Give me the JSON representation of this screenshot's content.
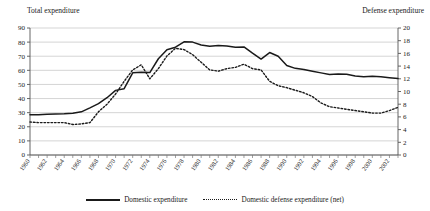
{
  "chart_data": {
    "type": "line",
    "title": "",
    "xlabel": "",
    "ylabel": "Total expenditure",
    "y2label": "Defense expenditure",
    "ylim": [
      0,
      90
    ],
    "y2lim": [
      0,
      20
    ],
    "grid": true,
    "legend_position": "bottom",
    "yticks": [
      0,
      10,
      20,
      30,
      40,
      50,
      60,
      70,
      80,
      90
    ],
    "y2ticks": [
      0,
      2,
      4,
      6,
      8,
      10,
      12,
      14,
      16,
      18,
      20
    ],
    "x": [
      1960,
      1961,
      1962,
      1963,
      1964,
      1965,
      1966,
      1967,
      1968,
      1969,
      1970,
      1971,
      1972,
      1973,
      1974,
      1975,
      1976,
      1977,
      1978,
      1979,
      1980,
      1981,
      1982,
      1983,
      1984,
      1985,
      1986,
      1987,
      1988,
      1989,
      1990,
      1991,
      1992,
      1993,
      1994,
      1995,
      1996,
      1997,
      1998,
      1999,
      2000,
      2001,
      2002,
      2003
    ],
    "xtick_labels": [
      "1960",
      "1962",
      "1964",
      "1966",
      "1968",
      "1970",
      "1972",
      "1974",
      "1976",
      "1978",
      "1980",
      "1982",
      "1984",
      "1986",
      "1988",
      "1990",
      "1992",
      "1994",
      "1996",
      "1998",
      "2000",
      "2002"
    ],
    "series": [
      {
        "name": "Domestic expenditure",
        "axis": "left",
        "style": "solid",
        "color": "#1a1a1a",
        "values": [
          28.6,
          28.6,
          28.8,
          29.0,
          29.2,
          29.6,
          30.6,
          33.4,
          36.4,
          40.6,
          45.8,
          47.0,
          58.2,
          58.6,
          58.4,
          68.2,
          74.6,
          76.4,
          80.2,
          80.0,
          78.0,
          77.0,
          77.6,
          77.2,
          76.4,
          76.6,
          72.2,
          68.0,
          72.6,
          70.0,
          63.4,
          61.4,
          60.6,
          59.4,
          58.2,
          57.0,
          57.4,
          57.2,
          56.0,
          55.4,
          55.8,
          55.4,
          54.8,
          54.2
        ]
      },
      {
        "name": "Domestic defense expenditure (net)",
        "axis": "right",
        "style": "dotted",
        "color": "#1a1a1a",
        "values": [
          5.2,
          5.1,
          5.1,
          5.1,
          5.1,
          4.8,
          4.9,
          5.1,
          6.8,
          8.0,
          9.6,
          11.6,
          13.4,
          14.2,
          12.0,
          13.6,
          15.6,
          16.8,
          16.6,
          15.8,
          14.6,
          13.4,
          13.2,
          13.6,
          13.8,
          14.3,
          13.6,
          13.4,
          11.6,
          10.9,
          10.6,
          10.2,
          9.8,
          9.2,
          8.2,
          7.6,
          7.4,
          7.2,
          7.0,
          6.8,
          6.6,
          6.6,
          7.0,
          7.5
        ]
      }
    ],
    "series2_right_tail": [
      55.6,
      55.4
    ]
  },
  "legend": {
    "items": [
      {
        "label": "Domestic expenditure",
        "style": "solid"
      },
      {
        "label": "Domestic defense expenditure (net)",
        "style": "dotted"
      }
    ]
  },
  "axes": {
    "left_title": "Total expenditure",
    "right_title": "Defense expenditure"
  }
}
